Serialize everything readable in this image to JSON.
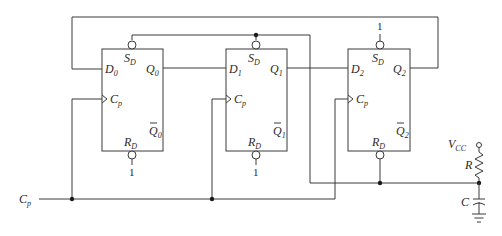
{
  "diagram": {
    "flipflops": [
      {
        "id": "FF0",
        "d": "D",
        "d_sub": "0",
        "q": "Q",
        "q_sub": "0",
        "qbar": "Q",
        "qbar_sub": "0",
        "clk": "C",
        "clk_sub": "p",
        "sd": "S",
        "sd_sub": "D",
        "rd": "R",
        "rd_sub": "D",
        "rd_tie": "1"
      },
      {
        "id": "FF1",
        "d": "D",
        "d_sub": "1",
        "q": "Q",
        "q_sub": "1",
        "qbar": "Q",
        "qbar_sub": "1",
        "clk": "C",
        "clk_sub": "p",
        "sd": "S",
        "sd_sub": "D",
        "rd": "R",
        "rd_sub": "D",
        "rd_tie": "1"
      },
      {
        "id": "FF2",
        "d": "D",
        "d_sub": "2",
        "q": "Q",
        "q_sub": "2",
        "qbar": "Q",
        "qbar_sub": "2",
        "clk": "C",
        "clk_sub": "p",
        "sd": "S",
        "sd_sub": "D",
        "rd": "R",
        "rd_sub": "D",
        "sd_tie": "1"
      }
    ],
    "clock_input": {
      "label": "C",
      "sub": "p"
    },
    "rc": {
      "vcc": "V",
      "vcc_sub": "CC",
      "resistor": "R",
      "capacitor": "C"
    }
  }
}
